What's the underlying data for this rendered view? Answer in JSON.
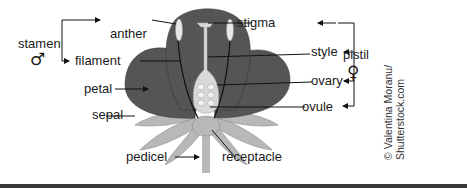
{
  "diagram": {
    "labels": {
      "stamen": "stamen",
      "male_symbol": "♂",
      "anther": "anther",
      "filament": "filament",
      "petal": "petal",
      "sepal": "sepal",
      "pedicel": "pedicel",
      "stigma": "stigma",
      "style": "style",
      "ovary": "ovary",
      "ovule": "ovule",
      "receptacle": "receptacle",
      "pistil": "pistil",
      "female_symbol": "♀"
    },
    "groups": {
      "stamen": [
        "anther",
        "filament"
      ],
      "pistil": [
        "stigma",
        "style",
        "ovary",
        "ovule"
      ]
    },
    "credit": {
      "line1": "© Valentina Moranu/",
      "line2": "Shutterstock.com"
    },
    "colors": {
      "petal": "#555555",
      "sepal": "#b8b8b8",
      "pistil": "#d8d8d8",
      "line": "#111111"
    }
  }
}
